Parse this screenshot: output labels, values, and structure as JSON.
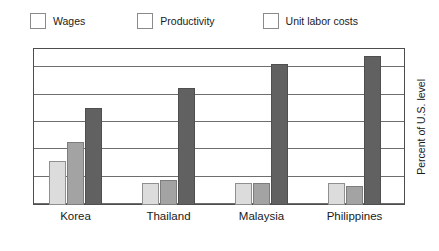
{
  "chart_data": {
    "type": "bar",
    "title": "",
    "subtitle": "",
    "xlabel": "",
    "ylabel": "Percent of U.S. level",
    "ylabel_position": "right",
    "ylim": [
      0,
      115
    ],
    "yticks": [
      0,
      20,
      40,
      60,
      80,
      100
    ],
    "ytick_labels": [
      "0",
      "20",
      "40",
      "60",
      "80",
      "100"
    ],
    "grid": true,
    "grid_axis": "y",
    "legend_position": "top-left",
    "categories": [
      "Korea",
      "Thailand",
      "Malaysia",
      "Philippines"
    ],
    "series": [
      {
        "name": "Wages",
        "color": "#dcdcdc",
        "values": [
          32,
          16,
          16,
          16
        ]
      },
      {
        "name": "Productivity",
        "color": "#a3a3a3",
        "values": [
          46,
          18,
          16,
          14
        ]
      },
      {
        "name": "Unit labor costs",
        "color": "#616161",
        "values": [
          71,
          86,
          103,
          109
        ]
      }
    ]
  },
  "legend": {
    "entries": [
      {
        "label": "Wages"
      },
      {
        "label": "Productivity"
      },
      {
        "label": "Unit labor costs"
      }
    ]
  },
  "axes": {
    "right_title": "Percent of U.S. level"
  }
}
